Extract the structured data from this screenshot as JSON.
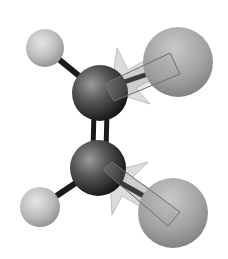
{
  "diagram": {
    "title": "Ball-and-stick model with bond dipole arrows",
    "background": "#ffffff",
    "colors": {
      "carbon": "#3a3a3a",
      "small_atom": "#bdbdbd",
      "large_atom": "#9a9a9a",
      "bond": "#1a1a1a",
      "arrow_fill": "#dcdcdc",
      "arrow_stroke": "#bfbfbf"
    },
    "atoms": [
      {
        "id": "c1",
        "role": "carbon",
        "cx": 100,
        "cy": 93,
        "r": 28
      },
      {
        "id": "c2",
        "role": "carbon",
        "cx": 98,
        "cy": 168,
        "r": 28
      },
      {
        "id": "h1",
        "role": "small_atom",
        "cx": 45,
        "cy": 48,
        "r": 19
      },
      {
        "id": "h2",
        "role": "small_atom",
        "cx": 40,
        "cy": 207,
        "r": 20
      },
      {
        "id": "x1",
        "role": "large_atom",
        "cx": 178,
        "cy": 62,
        "r": 35
      },
      {
        "id": "x2",
        "role": "large_atom",
        "cx": 173,
        "cy": 213,
        "r": 35
      }
    ],
    "bonds": [
      {
        "from": "c1",
        "to": "c2",
        "order": 2
      },
      {
        "from": "c1",
        "to": "h1",
        "order": 1
      },
      {
        "from": "c1",
        "to": "x1",
        "order": 1
      },
      {
        "from": "c2",
        "to": "h2",
        "order": 1
      },
      {
        "from": "c2",
        "to": "x2",
        "order": 1
      }
    ],
    "dipole_arrows": [
      {
        "from": "x1",
        "to": "c1",
        "direction": "toward carbon"
      },
      {
        "from": "x2",
        "to": "c2",
        "direction": "toward carbon"
      }
    ]
  }
}
